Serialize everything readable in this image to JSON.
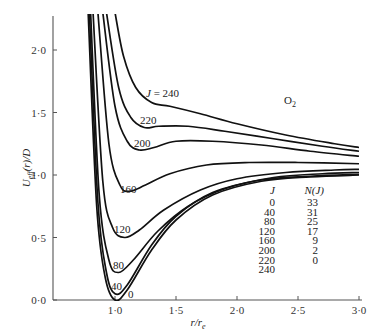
{
  "chart_data": {
    "type": "line",
    "title": "",
    "annotation": "O₂",
    "xlabel": "r/r_e",
    "ylabel": "U_eff(r)/D",
    "xlim": [
      0.7,
      3.0
    ],
    "ylim": [
      0.0,
      2.25
    ],
    "x_ticks": [
      "1·0",
      "1·5",
      "2·0",
      "2·5",
      "3·0"
    ],
    "y_ticks": [
      "0·0",
      "0·5",
      "1·0",
      "1·5",
      "2·0"
    ],
    "grid": false,
    "series": [
      {
        "name": "J=0",
        "label": "0",
        "points": [
          [
            0.78,
            2.3
          ],
          [
            0.85,
            0.75
          ],
          [
            0.92,
            0.18
          ],
          [
            1.0,
            0.0
          ],
          [
            1.1,
            0.08
          ],
          [
            1.3,
            0.4
          ],
          [
            1.5,
            0.64
          ],
          [
            1.8,
            0.84
          ],
          [
            2.2,
            0.95
          ],
          [
            2.6,
            0.985
          ],
          [
            3.0,
            1.0
          ]
        ]
      },
      {
        "name": "J=40",
        "label": "40",
        "points": [
          [
            0.79,
            2.3
          ],
          [
            0.86,
            0.78
          ],
          [
            0.93,
            0.22
          ],
          [
            1.0,
            0.05
          ],
          [
            1.1,
            0.12
          ],
          [
            1.3,
            0.44
          ],
          [
            1.5,
            0.67
          ],
          [
            1.8,
            0.86
          ],
          [
            2.2,
            0.96
          ],
          [
            2.6,
            0.99
          ],
          [
            3.0,
            1.005
          ]
        ]
      },
      {
        "name": "J=80",
        "label": "80",
        "points": [
          [
            0.8,
            2.3
          ],
          [
            0.87,
            0.85
          ],
          [
            0.95,
            0.32
          ],
          [
            1.03,
            0.22
          ],
          [
            1.15,
            0.32
          ],
          [
            1.35,
            0.55
          ],
          [
            1.6,
            0.75
          ],
          [
            1.9,
            0.89
          ],
          [
            2.3,
            0.98
          ],
          [
            2.7,
            1.01
          ],
          [
            3.0,
            1.02
          ]
        ]
      },
      {
        "name": "J=120",
        "label": "120",
        "points": [
          [
            0.82,
            2.3
          ],
          [
            0.9,
            0.95
          ],
          [
            0.98,
            0.58
          ],
          [
            1.08,
            0.5
          ],
          [
            1.2,
            0.56
          ],
          [
            1.4,
            0.72
          ],
          [
            1.7,
            0.88
          ],
          [
            2.0,
            0.97
          ],
          [
            2.4,
            1.02
          ],
          [
            2.8,
            1.04
          ],
          [
            3.0,
            1.045
          ]
        ]
      },
      {
        "name": "J=160",
        "label": "160",
        "points": [
          [
            0.86,
            2.3
          ],
          [
            0.95,
            1.25
          ],
          [
            1.04,
            0.92
          ],
          [
            1.12,
            0.87
          ],
          [
            1.25,
            0.92
          ],
          [
            1.45,
            1.01
          ],
          [
            1.75,
            1.08
          ],
          [
            2.1,
            1.1
          ],
          [
            2.5,
            1.1
          ],
          [
            3.0,
            1.09
          ]
        ]
      },
      {
        "name": "J=200",
        "label": "200",
        "points": [
          [
            0.9,
            2.3
          ],
          [
            1.0,
            1.55
          ],
          [
            1.1,
            1.27
          ],
          [
            1.2,
            1.2
          ],
          [
            1.32,
            1.22
          ],
          [
            1.5,
            1.27
          ],
          [
            1.8,
            1.27
          ],
          [
            2.2,
            1.24
          ],
          [
            2.6,
            1.19
          ],
          [
            3.0,
            1.15
          ]
        ]
      },
      {
        "name": "J=220",
        "label": "220",
        "points": [
          [
            0.93,
            2.3
          ],
          [
            1.03,
            1.7
          ],
          [
            1.13,
            1.46
          ],
          [
            1.24,
            1.38
          ],
          [
            1.36,
            1.39
          ],
          [
            1.6,
            1.39
          ],
          [
            1.9,
            1.35
          ],
          [
            2.3,
            1.29
          ],
          [
            2.7,
            1.23
          ],
          [
            3.0,
            1.19
          ]
        ]
      },
      {
        "name": "J=240",
        "label": "J = 240",
        "points": [
          [
            1.0,
            2.3
          ],
          [
            1.07,
            1.95
          ],
          [
            1.17,
            1.7
          ],
          [
            1.3,
            1.58
          ],
          [
            1.45,
            1.55
          ],
          [
            1.7,
            1.49
          ],
          [
            2.0,
            1.41
          ],
          [
            2.4,
            1.32
          ],
          [
            2.8,
            1.25
          ],
          [
            3.0,
            1.22
          ]
        ]
      }
    ],
    "legend_table": {
      "headers": [
        "J",
        "N(J)"
      ],
      "rows": [
        [
          "0",
          "33"
        ],
        [
          "40",
          "31"
        ],
        [
          "80",
          "25"
        ],
        [
          "120",
          "17"
        ],
        [
          "160",
          "9"
        ],
        [
          "200",
          "2"
        ],
        [
          "220",
          "0"
        ],
        [
          "240",
          ""
        ]
      ]
    }
  },
  "axis": {
    "ylabel": "U",
    "ylabel_sub": "eff",
    "ylabel_rest": "(r)/D",
    "xlabel_main": "r/r",
    "xlabel_sub": "e"
  },
  "annotation": {
    "main": "O",
    "sub": "2"
  },
  "labels": {
    "j240": "J = 240",
    "j220": "220",
    "j200": "200",
    "j160": "160",
    "j120": "120",
    "j80": "80",
    "j40": "40",
    "j0": "0"
  },
  "style": {
    "line_color": "#111111",
    "axis_color": "#555555"
  }
}
